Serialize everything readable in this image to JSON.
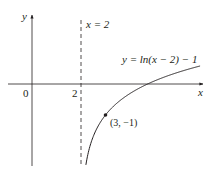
{
  "chart_data": {
    "type": "line",
    "title": "",
    "xlabel": "x",
    "ylabel": "y",
    "origin_label": "0",
    "x_ticks": [
      {
        "value": 2,
        "label": "2"
      }
    ],
    "asymptote": {
      "x": 2,
      "label": "x = 2",
      "style": "dashed"
    },
    "series": [
      {
        "name": "y = ln(x − 2) − 1",
        "function": "ln(x-2)-1",
        "x": [
          2.2,
          2.4,
          2.6,
          3.0,
          3.5,
          4.0,
          4.718,
          5.5,
          6.0,
          6.86
        ],
        "values": [
          -2.61,
          -1.92,
          -1.51,
          -1.0,
          -0.59,
          -0.31,
          0.0,
          0.25,
          0.39,
          0.58
        ]
      }
    ],
    "annotations": [
      {
        "point": [
          3,
          -1
        ],
        "label": "(3, −1)"
      }
    ],
    "xlim": [
      -1.3,
      7.1
    ],
    "ylim": [
      -2.6,
      2.7
    ],
    "grid": false,
    "colors": {
      "curve": "#231f20",
      "axes": "#231f20"
    }
  },
  "labels": {
    "y_axis": "y",
    "x_axis": "x",
    "origin": "0",
    "tick_2": "2",
    "asymptote": "x = 2",
    "curve": "y = ln(x − 2) − 1",
    "point": "(3, −1)"
  }
}
